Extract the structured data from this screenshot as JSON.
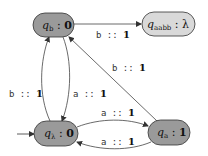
{
  "diagram": {
    "type": "weighted-automaton",
    "initial_state": "q_lambda",
    "colors": {
      "state_fill": "#9a9a9a",
      "final_state_fill": "#d9d9d9",
      "stroke": "#333333",
      "edge": "#444444"
    },
    "states": [
      {
        "id": "q_b",
        "name": "q",
        "sub": "b",
        "sep": " : ",
        "output": "0",
        "output_bold": true
      },
      {
        "id": "q_aabb",
        "name": "q",
        "sub": "aabb",
        "sep": " : ",
        "output": "λ",
        "output_bold": false
      },
      {
        "id": "q_lambda",
        "name": "q",
        "sub": "λ",
        "sep": " : ",
        "output": "0",
        "output_bold": true
      },
      {
        "id": "q_a",
        "name": "q",
        "sub": "a",
        "sep": " : ",
        "output": "1",
        "output_bold": true
      }
    ],
    "edges": [
      {
        "from": "q_b",
        "to": "q_aabb",
        "symbol": "b",
        "sep": " :: ",
        "weight": "1"
      },
      {
        "from": "q_lambda",
        "to": "q_b",
        "symbol": "b",
        "sep": " :: ",
        "weight": "1"
      },
      {
        "from": "q_b",
        "to": "q_lambda",
        "symbol": "a",
        "sep": " :: ",
        "weight": "1"
      },
      {
        "from": "q_a",
        "to": "q_b",
        "symbol": "b",
        "sep": " :: ",
        "weight": "1"
      },
      {
        "from": "q_lambda",
        "to": "q_a",
        "symbol": "a",
        "sep": " :: ",
        "weight": "1"
      },
      {
        "from": "q_a",
        "to": "q_lambda",
        "symbol": "a",
        "sep": " :: ",
        "weight": "1"
      }
    ]
  }
}
